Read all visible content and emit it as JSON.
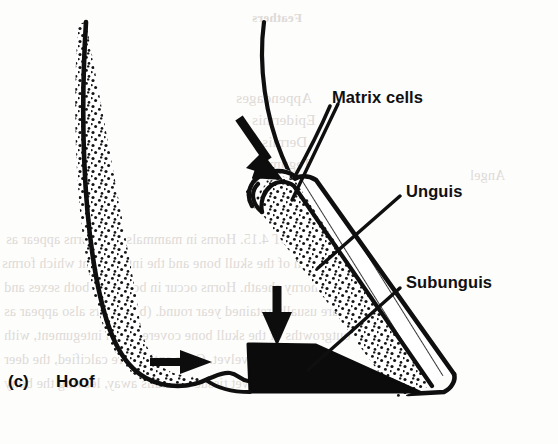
{
  "figure": {
    "caption_index": "(c)",
    "caption_title": "Hoof",
    "type": "anatomical line drawing (scanned textbook page)",
    "background_color": "#fdfdfc",
    "ink_color": "#101010"
  },
  "labels": [
    {
      "id": "matrix-cells",
      "text": "Matrix cells",
      "x": 332,
      "y": 88
    },
    {
      "id": "unguis",
      "text": "Unguis",
      "x": 406,
      "y": 182
    },
    {
      "id": "subunguis",
      "text": "Subunguis",
      "x": 406,
      "y": 273
    }
  ],
  "arrows": [
    {
      "id": "growth-arrow-upper",
      "direction": "down-right",
      "note": "thick solid arrow pointing at the proximal hoof fold"
    },
    {
      "id": "growth-arrow-lower",
      "direction": "down",
      "note": "thick solid arrow pointing at the subunguis sole"
    },
    {
      "id": "growth-arrow-left",
      "direction": "right",
      "note": "small solid arrow inside the distal phalanx pad"
    }
  ],
  "structures": [
    {
      "id": "phalanx-left",
      "name": "terminal phalanx / dermal pad (stippled)",
      "fill": "stipple"
    },
    {
      "id": "hoof-wall",
      "name": "unguis (hoof wall, hatched)",
      "fill": "diagonal hatching"
    },
    {
      "id": "hoof-dermis",
      "name": "dermal lamellae (stippled band)",
      "fill": "stipple"
    },
    {
      "id": "subunguis-wedge",
      "name": "subunguis (sole, solid black)",
      "fill": "#0b0b0b"
    },
    {
      "id": "matrix-fold",
      "name": "matrix cells / proximal nail fold",
      "fill": "outline + stipple"
    }
  ],
  "bleed_through_text": [
    {
      "text": "Feathers",
      "x": 252,
      "y": 10,
      "size": 13,
      "weight": "700"
    },
    {
      "text": "Appendages",
      "x": 236,
      "y": 90,
      "size": 15,
      "weight": "400"
    },
    {
      "text": "Epidermis",
      "x": 252,
      "y": 112,
      "size": 15,
      "weight": "400"
    },
    {
      "text": "Dermis",
      "x": 262,
      "y": 134,
      "size": 15,
      "weight": "400"
    },
    {
      "text": "Tegument",
      "x": 250,
      "y": 156,
      "size": 15,
      "weight": "400"
    },
    {
      "text": "Angel",
      "x": 470,
      "y": 168,
      "size": 14,
      "weight": "400"
    },
    {
      "text": "OBJECT 4.15.   Horns in mammals. (a) Horns appear as",
      "x": 6,
      "y": 232,
      "size": 14,
      "weight": "400"
    },
    {
      "text": "outgrowth of the skull bone and the integument which forms",
      "x": 2,
      "y": 256,
      "size": 14,
      "weight": "400"
    },
    {
      "text": "a horny sheath. Horns occur in bovids in both sexes and",
      "x": 4,
      "y": 280,
      "size": 14,
      "weight": "400"
    },
    {
      "text": "are usually retained year round. (b) Antlers also appear as",
      "x": 4,
      "y": 304,
      "size": 14,
      "weight": "400"
    },
    {
      "text": "outgrowths of the skull bone covered with integument, with",
      "x": 4,
      "y": 328,
      "size": 14,
      "weight": "400"
    },
    {
      "text": "referred to as velvet. Once antlers are calcified, the deer",
      "x": 4,
      "y": 352,
      "size": 14,
      "weight": "400"
    },
    {
      "text": "rub, stripping velvet tissue and falls away, leaving the bony",
      "x": 4,
      "y": 376,
      "size": 14,
      "weight": "400"
    }
  ]
}
